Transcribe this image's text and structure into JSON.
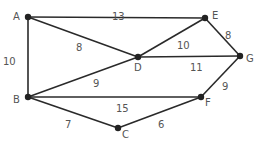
{
  "graph": {
    "nodes": [
      {
        "id": "A",
        "label": "A",
        "x": 28,
        "y": 17,
        "lx": 13,
        "ly": 20
      },
      {
        "id": "B",
        "label": "B",
        "x": 28,
        "y": 97,
        "lx": 13,
        "ly": 103
      },
      {
        "id": "C",
        "label": "C",
        "x": 118,
        "y": 128,
        "lx": 122,
        "ly": 138
      },
      {
        "id": "D",
        "label": "D",
        "x": 138,
        "y": 57,
        "lx": 134,
        "ly": 71
      },
      {
        "id": "E",
        "label": "E",
        "x": 205,
        "y": 18,
        "lx": 212,
        "ly": 19
      },
      {
        "id": "F",
        "label": "F",
        "x": 201,
        "y": 97,
        "lx": 205,
        "ly": 106
      },
      {
        "id": "G",
        "label": "G",
        "x": 240,
        "y": 56,
        "lx": 246,
        "ly": 62
      }
    ],
    "edges": [
      {
        "from": "A",
        "to": "E",
        "weight": "13",
        "wx": 112,
        "wy": 16
      },
      {
        "from": "A",
        "to": "B",
        "weight": "10",
        "wx": 3,
        "wy": 61
      },
      {
        "from": "A",
        "to": "D",
        "weight": "8",
        "wx": 76,
        "wy": 47
      },
      {
        "from": "E",
        "to": "D",
        "weight": "10",
        "wx": 177,
        "wy": 45
      },
      {
        "from": "E",
        "to": "G",
        "weight": "8",
        "wx": 225,
        "wy": 35
      },
      {
        "from": "D",
        "to": "G",
        "weight": "11",
        "wx": 190,
        "wy": 67
      },
      {
        "from": "B",
        "to": "D",
        "weight": "9",
        "wx": 93,
        "wy": 83
      },
      {
        "from": "B",
        "to": "F",
        "weight": "15",
        "wx": 116,
        "wy": 108
      },
      {
        "from": "B",
        "to": "C",
        "weight": "7",
        "wx": 65,
        "wy": 124
      },
      {
        "from": "C",
        "to": "F",
        "weight": "6",
        "wx": 158,
        "wy": 124
      },
      {
        "from": "F",
        "to": "G",
        "weight": "9",
        "wx": 222,
        "wy": 86
      }
    ]
  },
  "colors": {
    "edge": "#2a2a2a",
    "node": "#222222",
    "text": "#555555",
    "background": "#ffffff"
  }
}
